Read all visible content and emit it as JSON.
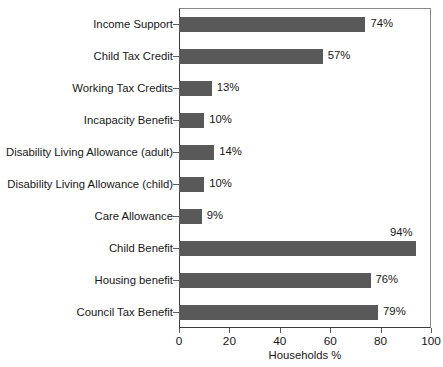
{
  "chart_data": {
    "type": "bar",
    "orientation": "horizontal",
    "title": "",
    "xlabel": "Households %",
    "ylabel": "",
    "xlim": [
      0,
      100
    ],
    "xticks": [
      "0",
      "20",
      "40",
      "60",
      "80",
      "100"
    ],
    "grid": false,
    "legend": null,
    "bar_color": "#595959",
    "categories": [
      "Income Support",
      "Child Tax Credit",
      "Working Tax Credits",
      "Incapacity Benefit",
      "Disability Living Allowance (adult)",
      "Disability Living Allowance (child)",
      "Care Allowance",
      "Child Benefit",
      "Housing benefit",
      "Council Tax Benefit"
    ],
    "values": [
      74,
      57,
      13,
      10,
      14,
      10,
      9,
      94,
      76,
      79
    ],
    "value_labels": [
      "74%",
      "57%",
      "13%",
      "10%",
      "14%",
      "10%",
      "9%",
      "94%",
      "76%",
      "79%"
    ],
    "value_label_position": [
      "right",
      "right",
      "right",
      "right",
      "right",
      "right",
      "right",
      "above",
      "right",
      "right"
    ]
  }
}
